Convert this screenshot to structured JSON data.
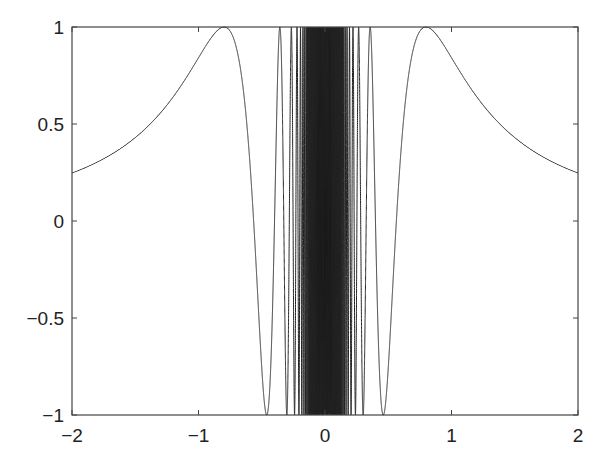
{
  "chart_data": {
    "type": "line",
    "title": "",
    "xlabel": "",
    "ylabel": "",
    "function": "sin(1/x^2)",
    "xlim": [
      -2,
      2
    ],
    "ylim": [
      -1,
      1
    ],
    "grid": false,
    "legend": null,
    "x_ticks": [
      "−2",
      "−1",
      "0",
      "1",
      "2"
    ],
    "y_ticks": [
      "1",
      "0.5",
      "0",
      "−0.5",
      "−1"
    ],
    "series": [
      {
        "name": "sin(1/x^2)",
        "color": "#222222",
        "sample_points": [
          {
            "x": -2.0,
            "y": 0.247
          },
          {
            "x": -1.5,
            "y": 0.432
          },
          {
            "x": -1.0,
            "y": 0.841
          },
          {
            "x": -0.8,
            "y": 1.0
          },
          {
            "x": -0.6,
            "y": 0.32
          },
          {
            "x": -0.46,
            "y": -1.0
          },
          {
            "x": -0.36,
            "y": 1.0
          },
          {
            "x": 0.36,
            "y": 1.0
          },
          {
            "x": 0.46,
            "y": -1.0
          },
          {
            "x": 0.6,
            "y": 0.32
          },
          {
            "x": 0.8,
            "y": 1.0
          },
          {
            "x": 1.0,
            "y": 0.841
          },
          {
            "x": 1.5,
            "y": 0.432
          },
          {
            "x": 2.0,
            "y": 0.247
          }
        ]
      }
    ]
  }
}
